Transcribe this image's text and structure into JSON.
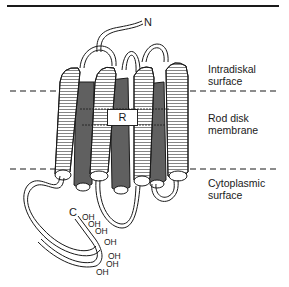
{
  "figure": {
    "labels": {
      "n_terminus": "N",
      "c_terminus": "C",
      "retinal": "R"
    },
    "regions": [
      {
        "line1": "Intradiskal",
        "line2": "surface"
      },
      {
        "line1": "Rod disk",
        "line2": "membrane"
      },
      {
        "line1": "Cytoplasmic",
        "line2": "surface"
      }
    ],
    "hydroxyls": [
      "OH",
      "OH",
      "OH",
      "OH",
      "OH",
      "OH",
      "OH"
    ],
    "helix_count": 7,
    "colors": {
      "ink": "#1a1a1a",
      "background": "#ffffff"
    }
  }
}
